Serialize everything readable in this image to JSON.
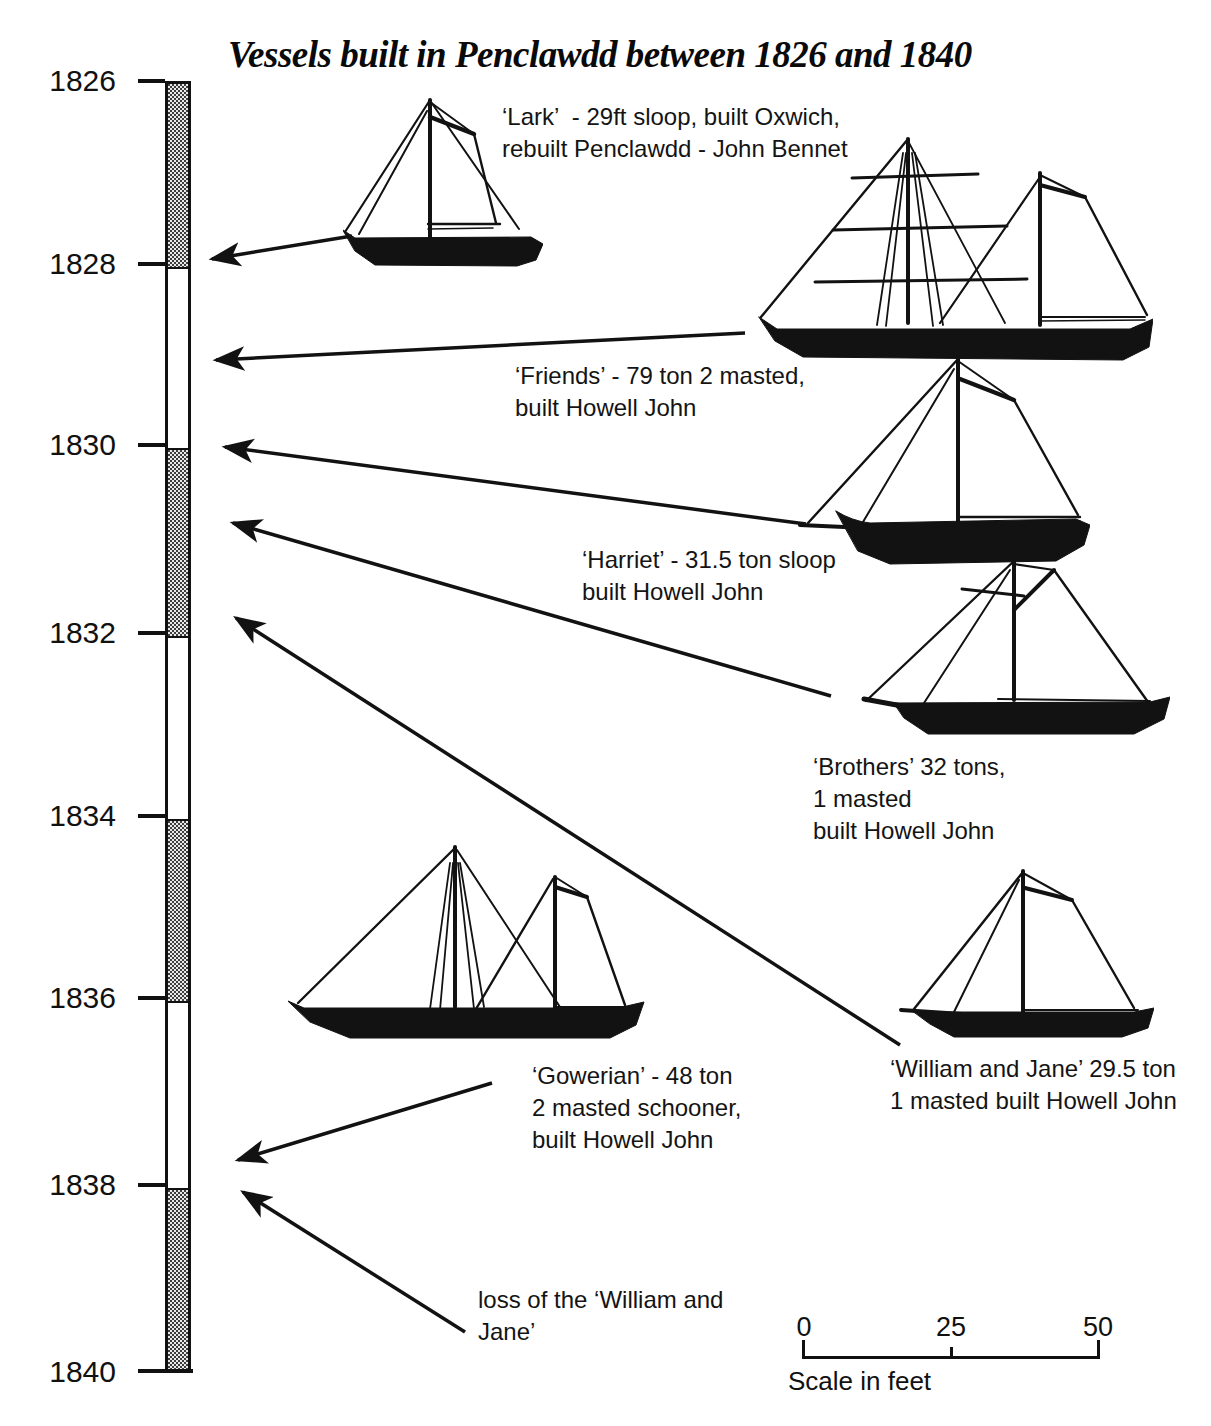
{
  "title": "Vessels built in Penclawdd between 1826 and 1840",
  "timeline": {
    "years": [
      "1826",
      "1828",
      "1830",
      "1832",
      "1834",
      "1836",
      "1838",
      "1840"
    ],
    "segments": [
      {
        "from": "1826",
        "to": "1828",
        "shaded": true
      },
      {
        "from": "1828",
        "to": "1830",
        "shaded": false
      },
      {
        "from": "1830",
        "to": "1832",
        "shaded": true
      },
      {
        "from": "1832",
        "to": "1834",
        "shaded": false
      },
      {
        "from": "1834",
        "to": "1836",
        "shaded": true
      },
      {
        "from": "1836",
        "to": "1838",
        "shaded": false
      },
      {
        "from": "1838",
        "to": "1840",
        "shaded": true
      }
    ]
  },
  "annotations": {
    "lark": {
      "lines": [
        "‘Lark’  - 29ft sloop, built Oxwich,",
        "rebuilt Penclawdd - John Bennet"
      ]
    },
    "friends": {
      "lines": [
        "‘Friends’ - 79 ton 2 masted,",
        "built Howell John"
      ]
    },
    "harriet": {
      "lines": [
        "‘Harriet’ - 31.5 ton sloop",
        "built Howell John"
      ]
    },
    "brothers": {
      "lines": [
        "‘Brothers’ 32 tons,",
        "1 masted",
        "built Howell John"
      ]
    },
    "gowerian": {
      "lines": [
        "‘Gowerian’ - 48 ton",
        "2 masted schooner,",
        "built Howell John"
      ]
    },
    "william_and_jane": {
      "lines": [
        "‘William and Jane’ 29.5 ton",
        "1 masted built Howell John"
      ]
    },
    "loss": {
      "lines": [
        "loss of the ‘William and",
        "Jane’"
      ]
    }
  },
  "scale_bar": {
    "tick_labels": [
      "0",
      "25",
      "50"
    ],
    "caption": "Scale in feet"
  },
  "colors": {
    "ink": "#121212",
    "background": "#ffffff"
  }
}
